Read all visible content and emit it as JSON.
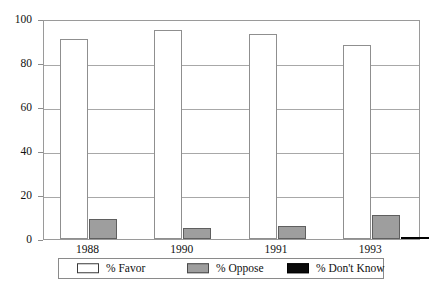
{
  "chart_data": {
    "type": "bar",
    "title": "",
    "subtitle": "",
    "xlabel": "",
    "ylabel": "",
    "categories": [
      "1988",
      "1990",
      "1991",
      "1993"
    ],
    "series": [
      {
        "name": "% Favor",
        "values": [
          91,
          95,
          93,
          88
        ],
        "color": "#ffffff"
      },
      {
        "name": "% Oppose",
        "values": [
          9,
          5,
          6,
          11
        ],
        "color": "#9e9e9e"
      },
      {
        "name": "% Don't Know",
        "values": [
          0,
          0,
          0,
          1
        ],
        "color": "#0a0a0a"
      }
    ],
    "ylim": [
      0,
      100
    ],
    "ytick_labels": [
      "0",
      "20",
      "40",
      "60",
      "80",
      "100"
    ],
    "ytick_values": [
      0,
      20,
      40,
      60,
      80,
      100
    ],
    "grid": true,
    "grid_axis": "y",
    "legend_position": "bottom",
    "bar_border_color": "#8f8f8f",
    "frame_color": "#9a9a9a"
  },
  "legend": {
    "items": [
      {
        "label": "% Favor",
        "swatch": "swatch-white-outline"
      },
      {
        "label": "% Oppose",
        "swatch": "swatch-gray-fill"
      },
      {
        "label": "% Don't Know",
        "swatch": "swatch-black-fill"
      }
    ]
  }
}
